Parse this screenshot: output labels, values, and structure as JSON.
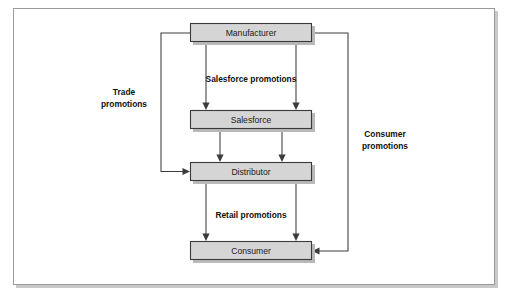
{
  "figure": {
    "type": "flow-diagram",
    "background_color": "#ffffff",
    "frame": {
      "border_color": "#9a9a9a",
      "fill_color": "#ffffff",
      "x": 13,
      "y": 8,
      "width": 482,
      "height": 277
    },
    "node_style": {
      "fill_color": "#d5d5d5",
      "border_color": "#3a3a3a",
      "shadow_color": "#b9b9b9"
    },
    "line_color": "#3c3c3c"
  },
  "nodes": [
    {
      "id": "manufacturer",
      "label": "Manufacturer",
      "x": 190,
      "y": 23,
      "width": 122,
      "height": 19
    },
    {
      "id": "salesforce",
      "label": "Salesforce",
      "x": 190,
      "y": 110,
      "width": 122,
      "height": 19
    },
    {
      "id": "distributor",
      "label": "Distributor",
      "x": 190,
      "y": 162,
      "width": 122,
      "height": 19
    },
    {
      "id": "consumer",
      "label": "Consumer",
      "x": 190,
      "y": 241,
      "width": 122,
      "height": 19
    }
  ],
  "edge_labels": [
    {
      "id": "salesforce-promotions",
      "text": "Salesforce promotions",
      "x": 251,
      "y": 79
    },
    {
      "id": "retail-promotions",
      "text": "Retail promotions",
      "x": 251,
      "y": 215
    }
  ],
  "side_labels": [
    {
      "id": "trade-promotions",
      "lines": [
        "Trade",
        "promotions"
      ],
      "x": 124,
      "y": 97
    },
    {
      "id": "consumer-promotions",
      "lines": [
        "Consumer",
        "promotions"
      ],
      "x": 385,
      "y": 139
    }
  ],
  "edges": [
    {
      "id": "manufacturer-to-salesforce-left",
      "from": "manufacturer",
      "to": "salesforce",
      "kind": "vertical",
      "x": 206
    },
    {
      "id": "manufacturer-to-salesforce-right",
      "from": "manufacturer",
      "to": "salesforce",
      "kind": "vertical",
      "x": 296
    },
    {
      "id": "salesforce-to-distributor-left",
      "from": "salesforce",
      "to": "distributor",
      "kind": "vertical",
      "x": 220
    },
    {
      "id": "salesforce-to-distributor-right",
      "from": "salesforce",
      "to": "distributor",
      "kind": "vertical",
      "x": 282
    },
    {
      "id": "distributor-to-consumer-left",
      "from": "distributor",
      "to": "consumer",
      "kind": "vertical",
      "x": 206
    },
    {
      "id": "distributor-to-consumer-right",
      "from": "distributor",
      "to": "consumer",
      "kind": "vertical",
      "x": 296
    },
    {
      "id": "trade-promotions-edge",
      "from": "manufacturer",
      "to": "distributor",
      "kind": "elbow-left",
      "label": "Trade promotions"
    },
    {
      "id": "consumer-promotions-edge",
      "from": "manufacturer",
      "to": "consumer",
      "kind": "elbow-right",
      "label": "Consumer promotions"
    }
  ]
}
